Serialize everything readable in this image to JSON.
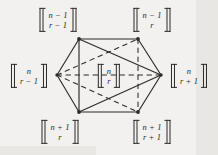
{
  "figure": {
    "background_color": "#f2f1ef",
    "ink_color": "#2b2b2b"
  },
  "nodes": [
    {
      "id": "top-left",
      "name": "node-top-left",
      "numerator": "n − 1",
      "denominator": "r − 1",
      "label_x": 58,
      "label_y": 20,
      "vertex_x": 79,
      "vertex_y": 39
    },
    {
      "id": "top-right",
      "name": "node-top-right",
      "numerator": "n − 1",
      "denominator": "r",
      "label_x": 152,
      "label_y": 20,
      "vertex_x": 138,
      "vertex_y": 39
    },
    {
      "id": "left",
      "name": "node-left",
      "numerator": "n",
      "denominator": "r − 1",
      "label_x": 29,
      "label_y": 76,
      "vertex_x": 57,
      "vertex_y": 75
    },
    {
      "id": "center",
      "name": "node-center",
      "numerator": "n",
      "denominator": "r",
      "label_x": 109,
      "label_y": 76,
      "vertex_x": 109,
      "vertex_y": 76
    },
    {
      "id": "right",
      "name": "node-right",
      "numerator": "n",
      "denominator": "r + 1",
      "label_x": 189,
      "label_y": 76,
      "vertex_x": 161,
      "vertex_y": 75
    },
    {
      "id": "bottom-left",
      "name": "node-bottom-left",
      "numerator": "n + 1",
      "denominator": "r",
      "label_x": 60,
      "label_y": 132,
      "vertex_x": 79,
      "vertex_y": 112
    },
    {
      "id": "bottom-right",
      "name": "node-bottom-right",
      "numerator": "n + 1",
      "denominator": "r + 1",
      "label_x": 152,
      "label_y": 132,
      "vertex_x": 138,
      "vertex_y": 112
    }
  ],
  "edges": [
    {
      "name": "edge-top",
      "from": "top-left",
      "to": "top-right",
      "style": "solid"
    },
    {
      "name": "edge-top-right-to-right",
      "from": "top-right",
      "to": "right",
      "style": "solid"
    },
    {
      "name": "edge-right-to-bottom-right",
      "from": "right",
      "to": "bottom-right",
      "style": "solid"
    },
    {
      "name": "edge-bottom",
      "from": "bottom-left",
      "to": "bottom-right",
      "style": "solid"
    },
    {
      "name": "edge-bottom-left-to-left",
      "from": "bottom-left",
      "to": "left",
      "style": "solid"
    },
    {
      "name": "edge-left-to-top-left",
      "from": "left",
      "to": "top-left",
      "style": "solid"
    },
    {
      "name": "edge-chord-left-vertical",
      "from": "top-left",
      "to": "bottom-left",
      "style": "solid"
    },
    {
      "name": "edge-chord-top-left-to-right",
      "from": "top-left",
      "to": "right",
      "style": "solid"
    },
    {
      "name": "edge-chord-bottom-left-to-right",
      "from": "bottom-left",
      "to": "right",
      "style": "solid"
    },
    {
      "name": "edge-chord-right-vertical",
      "from": "top-right",
      "to": "bottom-right",
      "style": "dashed"
    },
    {
      "name": "edge-chord-left-to-top-right",
      "from": "left",
      "to": "top-right",
      "style": "dashed"
    },
    {
      "name": "edge-chord-left-to-bottom-right",
      "from": "left",
      "to": "bottom-right",
      "style": "dashed"
    },
    {
      "name": "edge-chord-left-to-right",
      "from": "left",
      "to": "right",
      "style": "dashed"
    }
  ]
}
